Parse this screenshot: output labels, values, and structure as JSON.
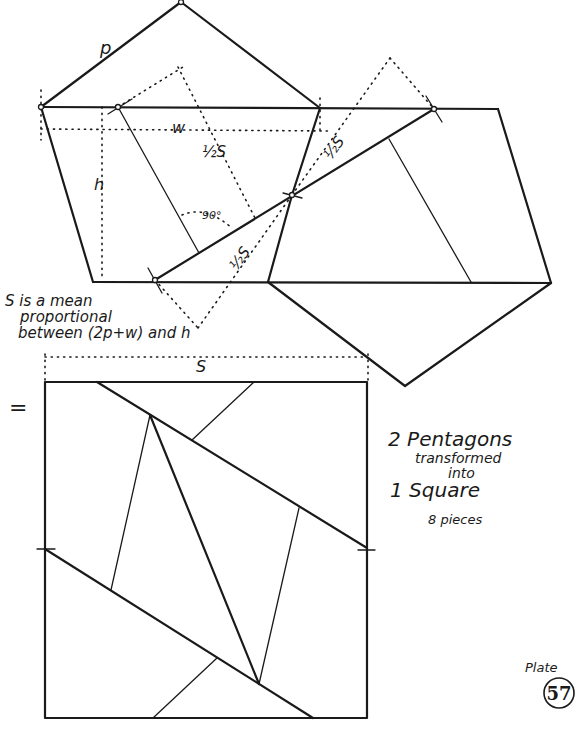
{
  "labels": {
    "p": "p",
    "w": "w",
    "h": "h",
    "half_s_1": "½S",
    "half_s_2": "½S",
    "half_s_3": "½S",
    "angle": "90°",
    "s_top": "S",
    "equals": "="
  },
  "note": {
    "line1": "S is a mean",
    "line2": "proportional",
    "line3": "between (2p+w) and h"
  },
  "title": {
    "line1": "2 Pentagons",
    "line2": "transformed",
    "line3": "into",
    "line4": "1 Square",
    "pieces": "8 pieces"
  },
  "plate": {
    "label": "Plate",
    "number": "57"
  },
  "colors": {
    "ink": "#1a1a1a",
    "paper": "#ffffff"
  }
}
